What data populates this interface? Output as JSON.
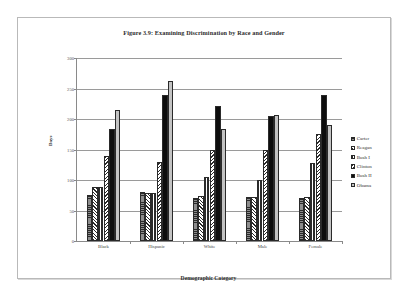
{
  "figure": {
    "title": "Figure 3.9: Examining Discrimination by Race and Gender",
    "ylabel": "Days",
    "xlabel": "Demographic Category"
  },
  "chart_data": {
    "type": "bar",
    "title": "Figure 3.9: Examining Discrimination by Race and Gender",
    "xlabel": "Demographic Category",
    "ylabel": "Days",
    "ylim": [
      0,
      300
    ],
    "yticks": [
      0,
      50,
      100,
      150,
      200,
      250,
      300
    ],
    "ytick_labels": [
      "0",
      "50",
      "100",
      "150",
      "200",
      "250",
      "300"
    ],
    "grid": true,
    "legend_position": "right",
    "categories": [
      "Black",
      "Hispanic",
      "White",
      "Male",
      "Female"
    ],
    "series": [
      {
        "name": "Carter",
        "pattern": "horizontal-hatch-gray",
        "values": [
          75,
          81,
          71,
          72,
          71
        ]
      },
      {
        "name": "Reagan",
        "pattern": "diagonal-hatch-up",
        "values": [
          88,
          78,
          73,
          72,
          72
        ]
      },
      {
        "name": "Bush I",
        "pattern": "vertical-hatch",
        "values": [
          88,
          78,
          105,
          100,
          128
        ]
      },
      {
        "name": "Clinton",
        "pattern": "diagonal-hatch-down",
        "values": [
          140,
          130,
          150,
          150,
          175
        ]
      },
      {
        "name": "Bush II",
        "pattern": "solid-black",
        "values": [
          183,
          240,
          222,
          205,
          240
        ]
      },
      {
        "name": "Obama",
        "pattern": "solid-light-gray",
        "values": [
          215,
          262,
          183,
          206,
          190
        ]
      }
    ],
    "colors": {
      "carter": "#8d8d8d",
      "reagan": "#ffffff",
      "bush_i": "#ffffff",
      "clinton": "#ffffff",
      "bush_ii": "#0d0d0d",
      "obama": "#c3c3c3",
      "gridline": "#9a9a9a",
      "axis": "#8a8a8a",
      "frame": "#b9b9b9"
    }
  }
}
